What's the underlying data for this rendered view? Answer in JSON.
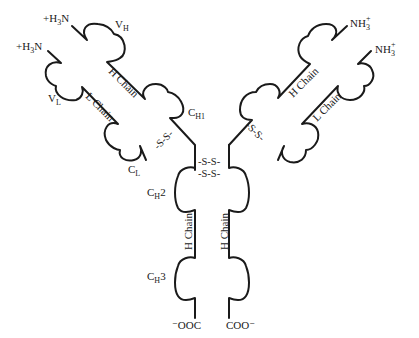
{
  "diagram": {
    "type": "antibody-structure",
    "termini": {
      "left_heavy_n": "+H3N",
      "left_light_n": "+H3N",
      "right_heavy_n": "NH3+",
      "right_light_n": "NH3+",
      "left_c": "−OOC",
      "right_c": "COO−"
    },
    "domain_labels": {
      "vh": {
        "base": "V",
        "sub": "H"
      },
      "vl": {
        "base": "V",
        "sub": "L"
      },
      "ch1": {
        "base": "C",
        "sub": "H1"
      },
      "cl": {
        "base": "C",
        "sub": "L"
      },
      "ch2": {
        "base": "C",
        "sub": "H",
        "suffix": "2"
      },
      "ch3": {
        "base": "C",
        "sub": "H",
        "suffix": "3"
      }
    },
    "chain_labels": {
      "left_heavy": "H Chain",
      "left_light": "L Chain",
      "right_heavy": "H Chain",
      "right_light": "L Chain",
      "stem_left": "H Chain",
      "stem_right": "H Chain"
    },
    "disulfide": {
      "left_arm": "-S-S-",
      "right_arm": "-S-S-",
      "hinge_1": "-S-S-",
      "hinge_2": "-S-S-"
    },
    "nh3": {
      "base": "NH",
      "sub": "3",
      "sup": "+"
    },
    "h3n": {
      "pre": "+H",
      "sub": "3",
      "post": "N"
    }
  }
}
